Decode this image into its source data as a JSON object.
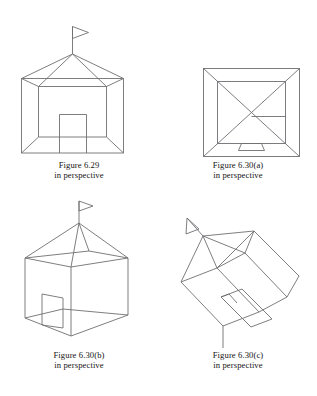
{
  "page": {
    "background_color": "#ffffff",
    "stroke_color": "#6f6f73",
    "text_color": "#141414"
  },
  "figures": [
    {
      "id": "fig-6-29",
      "name": "house-one-point-perspective",
      "caption_line1": "Figure 6.29",
      "caption_line2": "in perspective",
      "elements": [
        "flag",
        "pyramid-roof",
        "front-wall",
        "interior-walls",
        "door"
      ]
    },
    {
      "id": "fig-6-30-a",
      "name": "house-frontal-view-square",
      "caption_line1": "Figure 6.30(a)",
      "caption_line2": "in perspective",
      "elements": [
        "outer-square",
        "inner-square",
        "diagonals",
        "shelf-line",
        "door"
      ]
    },
    {
      "id": "fig-6-30-b",
      "name": "house-two-point-perspective",
      "caption_line1": "Figure 6.30(b)",
      "caption_line2": "in perspective",
      "elements": [
        "flag",
        "pyramid-roof",
        "box-walls",
        "interior-partition",
        "door"
      ]
    },
    {
      "id": "fig-6-30-c",
      "name": "house-rotated-tilted-perspective",
      "caption_line1": "Figure 6.30(c)",
      "caption_line2": "in perspective",
      "elements": [
        "flag",
        "pyramid-roof",
        "box-walls",
        "interior-partition",
        "door"
      ]
    }
  ]
}
